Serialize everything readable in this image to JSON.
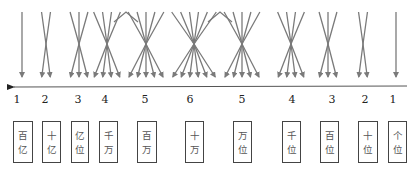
{
  "diagram": {
    "direction": "right-to-left",
    "line_color": "#7a7a7a",
    "axis_color": "#555555",
    "groups": [
      {
        "count": 1,
        "label": "1",
        "place": [
          "百",
          "亿"
        ]
      },
      {
        "count": 2,
        "label": "2",
        "place": [
          "十",
          "亿"
        ]
      },
      {
        "count": 3,
        "label": "3",
        "place": [
          "亿",
          "位"
        ]
      },
      {
        "count": 4,
        "label": "4",
        "place": [
          "千",
          "万"
        ]
      },
      {
        "count": 5,
        "label": "5",
        "place": [
          "百",
          "万"
        ]
      },
      {
        "count": 6,
        "label": "6",
        "place": [
          "十",
          "万"
        ]
      },
      {
        "count": 5,
        "label": "5",
        "place": [
          "万",
          "位"
        ]
      },
      {
        "count": 4,
        "label": "4",
        "place": [
          "千",
          "位"
        ]
      },
      {
        "count": 3,
        "label": "3",
        "place": [
          "百",
          "位"
        ]
      },
      {
        "count": 2,
        "label": "2",
        "place": [
          "十",
          "位"
        ]
      },
      {
        "count": 1,
        "label": "1",
        "place": [
          "个",
          "位"
        ]
      }
    ]
  }
}
